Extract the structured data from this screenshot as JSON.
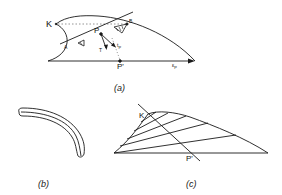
{
  "figure_a": {
    "caption": "(a)",
    "labels": {
      "K": "K",
      "A": "A",
      "B": "B",
      "P": "P",
      "P_prime": "P'",
      "T": "T",
      "t_P": "t",
      "t_P_sub": "P",
      "e_P": "ε",
      "e_P_sub": "P"
    }
  },
  "figure_b": {
    "caption": "(b)"
  },
  "figure_c": {
    "caption": "(c)",
    "labels": {
      "K": "K",
      "P_prime": "P'"
    }
  },
  "colors": {
    "stroke": "#1a1a1a",
    "dashed": "#888888",
    "background": "#ffffff"
  }
}
